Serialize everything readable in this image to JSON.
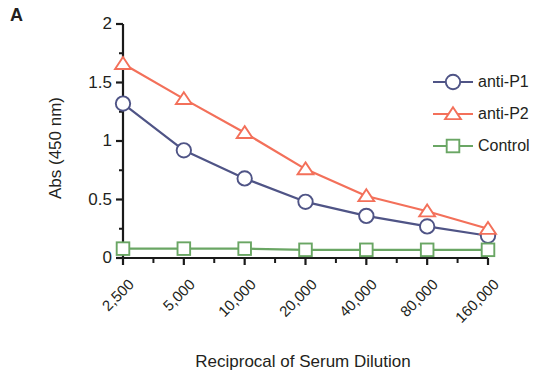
{
  "panel": {
    "label": "A"
  },
  "chart_data": {
    "type": "line",
    "title": "",
    "xlabel": "Reciprocal of Serum Dilution",
    "ylabel": "Abs (450 nm)",
    "categories": [
      "2,500",
      "5,000",
      "10,000",
      "20,000",
      "40,000",
      "80,000",
      "160,000"
    ],
    "x_tick_labels": [
      "2,500",
      "5,000",
      "10,000",
      "20,000",
      "40,000",
      "80,000",
      "160,000"
    ],
    "y_tick_labels": [
      "0",
      "0.5",
      "1",
      "1.5",
      "2"
    ],
    "y_tick_values": [
      0,
      0.5,
      1,
      1.5,
      2
    ],
    "ylim": [
      0,
      2
    ],
    "y_minor_ticks": [
      0.25,
      0.75,
      1.25,
      1.75
    ],
    "grid": false,
    "legend_position": "right",
    "x_axis_scale": "categorical (log2 serial dilution)",
    "series": [
      {
        "name": "anti-P1",
        "color": "#4f5486",
        "marker": "circle",
        "values": [
          1.32,
          0.92,
          0.68,
          0.48,
          0.36,
          0.27,
          0.19
        ]
      },
      {
        "name": "anti-P2",
        "color": "#f3705a",
        "marker": "triangle",
        "values": [
          1.66,
          1.36,
          1.07,
          0.76,
          0.53,
          0.4,
          0.25
        ]
      },
      {
        "name": "Control",
        "color": "#6aa664",
        "marker": "square",
        "values": [
          0.08,
          0.08,
          0.08,
          0.07,
          0.07,
          0.07,
          0.07
        ]
      }
    ]
  },
  "legend": {
    "items": [
      {
        "label": "anti-P1",
        "color": "#4f5486",
        "marker": "circle"
      },
      {
        "label": "anti-P2",
        "color": "#f3705a",
        "marker": "triangle"
      },
      {
        "label": "Control",
        "color": "#6aa664",
        "marker": "square"
      }
    ]
  },
  "axis": {
    "color": "#1a1a1a"
  }
}
